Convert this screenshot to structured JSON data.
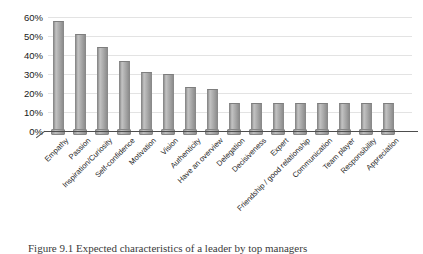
{
  "figure": {
    "caption": "Figure 9.1 Expected characteristics of a leader by top managers"
  },
  "chart_data": {
    "type": "bar",
    "title": "",
    "xlabel": "",
    "ylabel": "",
    "categories": [
      "Empathy",
      "Passion",
      "Inspiration/Curiosity",
      "Self-confidence",
      "Motivation",
      "Vision",
      "Authenticity",
      "Have an overview",
      "Delegation",
      "Decisiveness",
      "Expert",
      "Friendship / good relationship",
      "Communication",
      "Team player",
      "Responsibility",
      "Appreciation"
    ],
    "values": [
      58,
      51,
      44,
      37,
      31,
      30,
      23,
      22,
      15,
      15,
      15,
      15,
      15,
      15,
      15,
      15
    ],
    "ylim": [
      0,
      60
    ],
    "ytick_labels": [
      "0%",
      "10%",
      "20%",
      "30%",
      "40%",
      "50%",
      "60%"
    ],
    "ytick_values": [
      0,
      10,
      20,
      30,
      40,
      50,
      60
    ],
    "grid": true,
    "legend": "none",
    "bar_color": "#a6a6a6",
    "bar_edge_color": "#8a8a8a",
    "gridline_color": "#e3e3e3",
    "axis_color": "#4d4d4d",
    "label_color": "#262626"
  }
}
